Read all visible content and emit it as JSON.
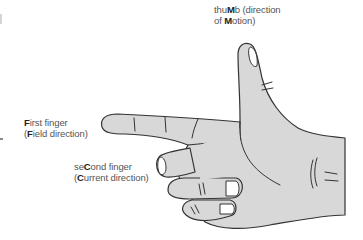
{
  "diagram": {
    "colors": {
      "skin": "#d8d8d8",
      "outline": "#333333",
      "nail": "#ffffff",
      "label_text": "#555555",
      "label_bold": "#222222"
    },
    "labels": {
      "thumb": {
        "line1_pre": "thu",
        "line1_bold": "M",
        "line1_post": "b (direction",
        "line2_pre": "of ",
        "line2_bold": "M",
        "line2_post": "otion)"
      },
      "first_finger": {
        "line1_bold": "F",
        "line1_post": "irst finger",
        "line2_pre": "(",
        "line2_bold": "F",
        "line2_post": "ield direction)"
      },
      "second_finger": {
        "line1_pre": "se",
        "line1_bold": "C",
        "line1_post": "ond finger",
        "line2_pre": "(",
        "line2_bold": "C",
        "line2_post": "urrent direction)"
      }
    }
  }
}
